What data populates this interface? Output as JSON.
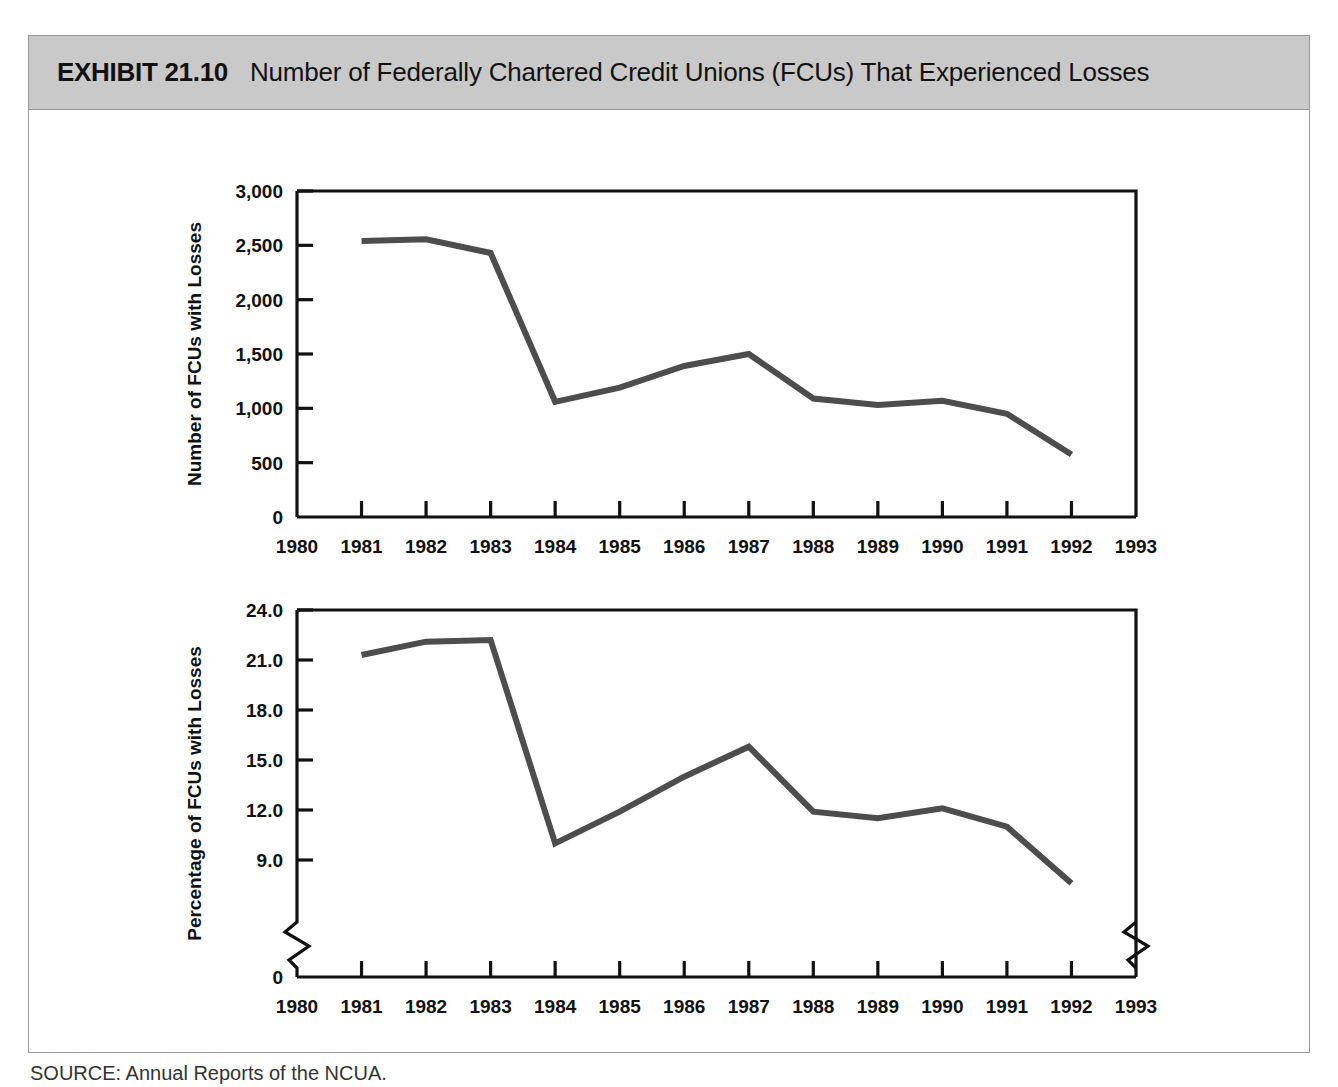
{
  "exhibit": {
    "label": "EXHIBIT 21.10",
    "title": "Number of Federally Chartered Credit Unions (FCUs) That Experienced Losses",
    "source": "SOURCE: Annual Reports of the NCUA.",
    "header_bg": "#c9c9c9",
    "line_color": "#4d4d4d",
    "axis_color": "#111111"
  },
  "chart_data": [
    {
      "type": "line",
      "title": "Number of Federally Chartered Credit Unions (FCUs) That Experienced Losses",
      "xlabel": "",
      "ylabel": "Number of FCUs with Losses",
      "x": [
        1981,
        1982,
        1983,
        1984,
        1985,
        1986,
        1987,
        1988,
        1989,
        1990,
        1991,
        1992
      ],
      "values": [
        2540,
        2555,
        2430,
        1060,
        1190,
        1390,
        1500,
        1090,
        1030,
        1070,
        950,
        575
      ],
      "xticks": [
        1980,
        1981,
        1982,
        1983,
        1984,
        1985,
        1986,
        1987,
        1988,
        1989,
        1990,
        1991,
        1992,
        1993
      ],
      "xticklabels": [
        "1980",
        "1981",
        "1982",
        "1983",
        "1984",
        "1985",
        "1986",
        "1987",
        "1988",
        "1989",
        "1990",
        "1991",
        "1992",
        "1993"
      ],
      "yticks": [
        0,
        500,
        1000,
        1500,
        2000,
        2500,
        3000
      ],
      "yticklabels": [
        "0",
        "500",
        "1,000",
        "1,500",
        "2,000",
        "2,500",
        "3,000"
      ],
      "xlim": [
        1980,
        1993
      ],
      "ylim": [
        0,
        3000
      ],
      "grid": false,
      "legend": false,
      "axis_break": false
    },
    {
      "type": "line",
      "title": "",
      "xlabel": "Year",
      "ylabel": "Percentage of FCUs with Losses",
      "x": [
        1981,
        1982,
        1983,
        1984,
        1985,
        1986,
        1987,
        1988,
        1989,
        1990,
        1991,
        1992
      ],
      "values": [
        21.3,
        22.1,
        22.2,
        10.0,
        11.9,
        14.0,
        15.8,
        11.9,
        11.5,
        12.1,
        11.0,
        7.6
      ],
      "xticks": [
        1980,
        1981,
        1982,
        1983,
        1984,
        1985,
        1986,
        1987,
        1988,
        1989,
        1990,
        1991,
        1992,
        1993
      ],
      "xticklabels": [
        "1980",
        "1981",
        "1982",
        "1983",
        "1984",
        "1985",
        "1986",
        "1987",
        "1988",
        "1989",
        "1990",
        "1991",
        "1992",
        "1993"
      ],
      "yticks": [
        0,
        9.0,
        12.0,
        15.0,
        18.0,
        21.0,
        24.0
      ],
      "yticklabels": [
        "0",
        "9.0",
        "12.0",
        "15.0",
        "18.0",
        "21.0",
        "24.0"
      ],
      "xlim": [
        1980,
        1993
      ],
      "ylim": [
        0,
        24
      ],
      "grid": false,
      "legend": false,
      "axis_break": true
    }
  ]
}
